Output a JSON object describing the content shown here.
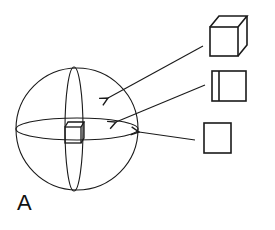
{
  "figure": {
    "panel_label": "A",
    "stroke_color": "#1a1a1a",
    "background": "#ffffff"
  },
  "sphere": {
    "name": "sphere-with-orthogonal-planes",
    "center": [
      77,
      129
    ],
    "radius": 61
  },
  "inset_items": [
    {
      "name": "volume-cube",
      "description": "3D cube (volume)"
    },
    {
      "name": "slab-plane",
      "description": "square with thin strip (plane slab)"
    },
    {
      "name": "surface-square",
      "description": "flat square (surface)"
    }
  ],
  "arrows": [
    {
      "from": "volume-cube",
      "to": "sphere-interior"
    },
    {
      "from": "slab-plane",
      "to": "equatorial-plane"
    },
    {
      "from": "surface-square",
      "to": "sphere-surface"
    }
  ]
}
